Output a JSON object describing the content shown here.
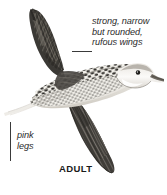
{
  "plate": {
    "subject": "rail in flight, lateral view",
    "background_color": "#ffffff",
    "width": 167,
    "height": 195
  },
  "annotations": {
    "wing": {
      "name": "wing-annotation",
      "lines": [
        "strong, narrow",
        "but rounded,",
        "rufous wings"
      ],
      "text": "strong, narrow but rounded, rufous wings",
      "style": "italic",
      "color": "#2b2b2b"
    },
    "legs": {
      "name": "legs-annotation",
      "lines": [
        "pink",
        "legs"
      ],
      "text": "pink legs",
      "style": "italic",
      "color": "#2b2b2b"
    }
  },
  "labels": {
    "age_stage": "ADULT"
  },
  "colors": {
    "ink_dark": "#2b2b2b",
    "plumage_dark": "#3b3935",
    "plumage_mid": "#6e6a63",
    "plumage_light": "#d8d5ce",
    "bare_parts_pale": "#efece6",
    "leader_line": "#3a3a3a"
  }
}
